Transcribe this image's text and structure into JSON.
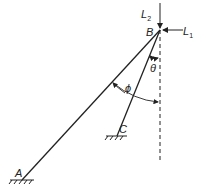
{
  "diagram": {
    "type": "mechanism",
    "points": {
      "A": {
        "label": "A",
        "x": 22,
        "y": 180,
        "support": "fixed"
      },
      "B": {
        "label": "B",
        "x": 160,
        "y": 30,
        "support": "joint"
      },
      "C": {
        "label": "C",
        "x": 117,
        "y": 136,
        "support": "fixed"
      }
    },
    "members": [
      {
        "from": "A",
        "to": "B"
      },
      {
        "from": "C",
        "to": "B"
      }
    ],
    "loads": [
      {
        "label": "L",
        "subscript": "2",
        "direction": "down"
      },
      {
        "label": "L",
        "subscript": "1",
        "direction": "left"
      }
    ],
    "angles": [
      {
        "label": "θ",
        "between": "BC and vertical"
      },
      {
        "label": "ϕ",
        "between": "BA and vertical"
      }
    ],
    "colors": {
      "line": "#222222",
      "background": "#ffffff"
    }
  }
}
